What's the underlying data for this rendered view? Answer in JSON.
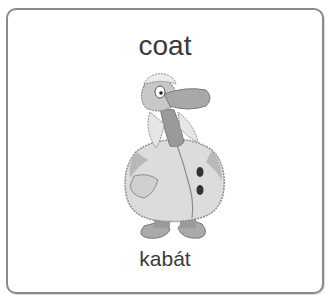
{
  "card": {
    "word": "coat",
    "translation": "kabát",
    "illustration": {
      "icon": "bear-in-coat-icon",
      "description": "cartoon bear wearing a fur-trimmed winter coat"
    }
  },
  "colors": {
    "border": "#8a8a8a",
    "text": "#3a3a3a",
    "background": "#ffffff"
  }
}
